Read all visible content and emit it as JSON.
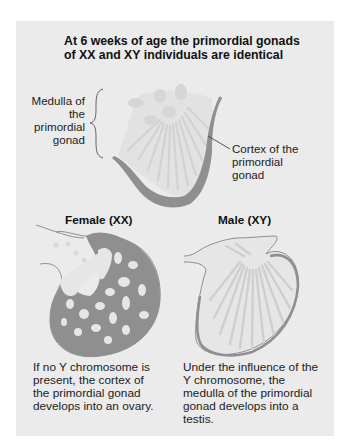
{
  "title": "At 6 weeks of age the primordial gonads of XX and XY individuals are identical",
  "primordial": {
    "medulla_label": "Medulla of the primordial gonad",
    "cortex_label": "Cortex of the primordial gonad"
  },
  "female": {
    "heading": "Female (XX)",
    "caption": "If no Y chromosome is present, the cortex of the primordial gonad develops into an ovary."
  },
  "male": {
    "heading": "Male (XY)",
    "caption": "Under the influence of the Y chromosome, the medulla of the primordial gonad develops into a testis."
  },
  "colors": {
    "panel_background": "#ebebeb",
    "cortex_gray": "#8f8f8f",
    "medulla_light": "#dcdcdc",
    "text": "#1a1a1a"
  }
}
